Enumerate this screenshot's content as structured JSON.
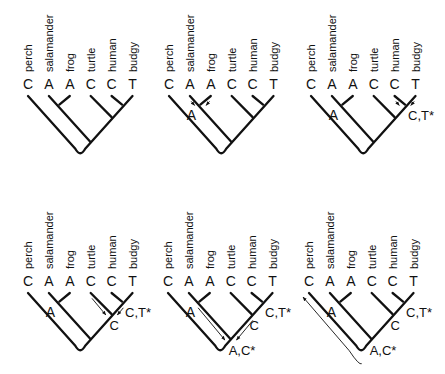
{
  "figure": {
    "taxa": [
      "perch",
      "salamander",
      "frog",
      "turtle",
      "human",
      "budgy"
    ],
    "tip_states": [
      "C",
      "A",
      "A",
      "C",
      "C",
      "T"
    ],
    "arrow_color": "#111111",
    "panels": [
      {
        "id": 1,
        "origin": [
          28,
          92
        ],
        "ancestral_labels": [],
        "arrows": []
      },
      {
        "id": 2,
        "origin": [
          169,
          92
        ],
        "ancestral_labels": [
          {
            "node": "salamander_frog",
            "text": "A"
          }
        ],
        "arrows": [
          {
            "type": "to-node",
            "from": "salamander",
            "to": "salamander_frog"
          },
          {
            "type": "to-node",
            "from": "frog",
            "to": "salamander_frog"
          }
        ]
      },
      {
        "id": 3,
        "origin": [
          311,
          92
        ],
        "ancestral_labels": [
          {
            "node": "salamander_frog",
            "text": "A"
          },
          {
            "node": "human_budgy",
            "text": "C,T*"
          }
        ],
        "arrows": [
          {
            "type": "to-node",
            "from": "human",
            "to": "human_budgy"
          },
          {
            "type": "to-node",
            "from": "budgy",
            "to": "human_budgy"
          }
        ]
      },
      {
        "id": 4,
        "origin": [
          28,
          289
        ],
        "ancestral_labels": [
          {
            "node": "salamander_frog",
            "text": "A"
          },
          {
            "node": "human_budgy",
            "text": "C,T*"
          },
          {
            "node": "turtle_node",
            "text": "C"
          }
        ],
        "arrows": [
          {
            "type": "to-node",
            "from": "turtle",
            "to": "turtle_node"
          },
          {
            "type": "to-node",
            "from": "human_budgy",
            "to": "turtle_node"
          }
        ]
      },
      {
        "id": 5,
        "origin": [
          168,
          289
        ],
        "ancestral_labels": [
          {
            "node": "salamander_frog",
            "text": "A"
          },
          {
            "node": "human_budgy",
            "text": "C,T*"
          },
          {
            "node": "turtle_node",
            "text": "C"
          },
          {
            "node": "amphibian_amniote",
            "text": "A,C*"
          }
        ],
        "arrows": [
          {
            "type": "to-node",
            "from": "salamander_frog",
            "to": "amphibian_amniote"
          },
          {
            "type": "to-node",
            "from": "turtle_node",
            "to": "amphibian_amniote"
          }
        ]
      },
      {
        "id": 6,
        "origin": [
          309,
          289
        ],
        "ancestral_labels": [
          {
            "node": "salamander_frog",
            "text": "A"
          },
          {
            "node": "human_budgy",
            "text": "C,T*"
          },
          {
            "node": "turtle_node",
            "text": "C"
          },
          {
            "node": "amphibian_amniote",
            "text": "A,C*"
          }
        ],
        "arrows": [
          {
            "type": "root-to-perch",
            "from": "amphibian_amniote",
            "to": "perch"
          }
        ]
      }
    ]
  }
}
